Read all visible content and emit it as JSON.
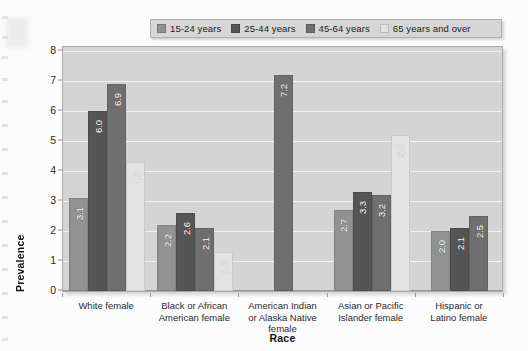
{
  "chart_data": {
    "type": "bar",
    "title": "",
    "xlabel": "Race",
    "ylabel": "Prevalence",
    "ylim": [
      0,
      8
    ],
    "yticks": [
      0,
      1,
      2,
      3,
      4,
      5,
      6,
      7,
      8
    ],
    "grid": true,
    "legend_position": "top",
    "categories": [
      "White female",
      "Black or African American female",
      "American Indian or Alaska Native female",
      "Asian or Pacific Islander female",
      "Hispanic or Latino female"
    ],
    "category_lines": [
      [
        "White female"
      ],
      [
        "Black or African",
        "American female"
      ],
      [
        "American Indian",
        "or Alaska Native",
        "female"
      ],
      [
        "Asian or Pacific",
        "Islander female"
      ],
      [
        "Hispanic or",
        "Latino female"
      ]
    ],
    "series": [
      {
        "name": "15-24 years",
        "color": "#919191",
        "values": [
          3.1,
          2.2,
          null,
          2.7,
          2.0
        ],
        "labels": [
          "3.1",
          "2.2",
          "",
          "2.7",
          "2.0"
        ]
      },
      {
        "name": "25-44 years",
        "color": "#555555",
        "values": [
          6.0,
          2.6,
          null,
          3.3,
          2.1
        ],
        "labels": [
          "6.0",
          "2.6",
          "",
          "3.3",
          "2.1"
        ]
      },
      {
        "name": "45-64 years",
        "color": "#6f6f6f",
        "values": [
          6.9,
          2.1,
          7.2,
          3.2,
          2.5
        ],
        "labels": [
          "6.9",
          "2.1",
          "7.2",
          "3.2",
          "2.5"
        ]
      },
      {
        "name": "65 years and over",
        "color": "#e3e3e3",
        "values": [
          4.3,
          1.3,
          null,
          5.2,
          null
        ],
        "labels": [
          "4.3",
          "1.3",
          "",
          "5.2",
          ""
        ]
      }
    ],
    "plot_background": "#d4d4d4",
    "gridline_color": "#f2f2f2",
    "legend_background": "#d6d6d6"
  }
}
